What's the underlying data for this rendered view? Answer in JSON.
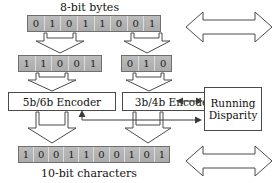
{
  "diagram": {
    "colors": {
      "cell_fill": "#b4b4b4",
      "cell_border": "#6f6f6f",
      "line": "#3a3a3a",
      "box_fill": "#ffffff",
      "background": "#ffffff",
      "text": "#111111"
    },
    "labels": {
      "top_caption": "8-bit bytes",
      "bottom_caption": "10-bit characters"
    },
    "byte_row": {
      "name": "8-bit byte",
      "bits": [
        "0",
        "1",
        "0",
        "1",
        "1",
        "0",
        "0",
        "1"
      ]
    },
    "split_rows": {
      "five_bit": {
        "name": "5-bit group",
        "bits": [
          "1",
          "1",
          "0",
          "0",
          "1"
        ]
      },
      "three_bit": {
        "name": "3-bit group",
        "bits": [
          "0",
          "1",
          "0"
        ]
      }
    },
    "encoders": [
      {
        "name": "5b6b-encoder",
        "label": "5b/6b Encoder"
      },
      {
        "name": "3b4b-encoder",
        "label": "3b/4b Encoder"
      }
    ],
    "running_disparity": {
      "name": "running-disparity",
      "line1": "Running",
      "line2": "Disparity"
    },
    "character_row": {
      "name": "10-bit character",
      "bits": [
        "1",
        "0",
        "0",
        "1",
        "1",
        "0",
        "0",
        "1",
        "0",
        "1"
      ]
    },
    "block_arrows": [
      {
        "name": "buffer",
        "label": "Buffer"
      },
      {
        "name": "serdes",
        "label": "SERDES"
      }
    ]
  }
}
